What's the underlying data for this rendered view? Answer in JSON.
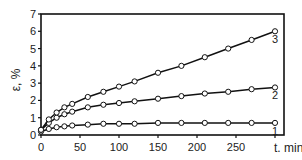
{
  "chart_data": {
    "type": "line",
    "title": "",
    "xlabel": "t, min",
    "ylabel": "ε, %",
    "xlim": [
      0,
      300
    ],
    "ylim": [
      0,
      7
    ],
    "xticks": [
      0,
      50,
      100,
      150,
      200,
      250
    ],
    "yticks": [
      0,
      1,
      2,
      3,
      4,
      5,
      6,
      7
    ],
    "grid": false,
    "legend": "curve labels at right end",
    "x": [
      0,
      10,
      20,
      30,
      40,
      60,
      80,
      100,
      120,
      150,
      180,
      210,
      240,
      270,
      300
    ],
    "series": [
      {
        "name": "1",
        "values": [
          0.2,
          0.35,
          0.45,
          0.5,
          0.55,
          0.6,
          0.65,
          0.65,
          0.65,
          0.7,
          0.7,
          0.7,
          0.7,
          0.7,
          0.7
        ]
      },
      {
        "name": "2",
        "values": [
          0.3,
          0.7,
          1.0,
          1.2,
          1.35,
          1.6,
          1.75,
          1.85,
          1.95,
          2.1,
          2.25,
          2.4,
          2.5,
          2.65,
          2.75
        ]
      },
      {
        "name": "3",
        "values": [
          0.3,
          0.9,
          1.3,
          1.6,
          1.8,
          2.2,
          2.5,
          2.8,
          3.1,
          3.6,
          4.0,
          4.5,
          5.0,
          5.5,
          6.0
        ]
      }
    ]
  },
  "labels": {
    "ylabel": "ε, %",
    "xlabel": "t. min"
  }
}
